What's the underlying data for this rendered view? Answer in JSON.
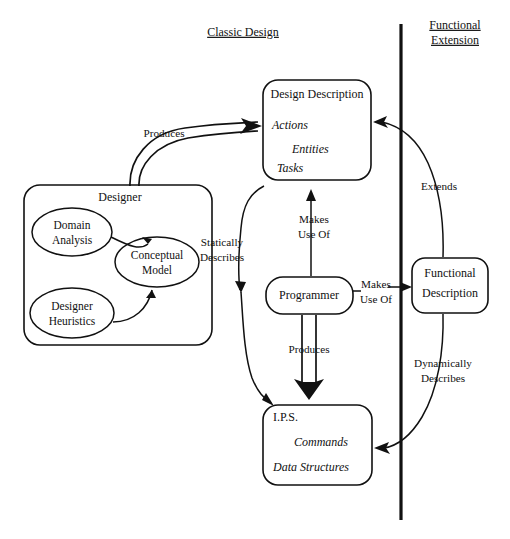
{
  "diagram": {
    "sections": [
      {
        "id": "classic",
        "label": "Classic Design"
      },
      {
        "id": "functional",
        "label_line1": "Functional",
        "label_line2": "Extension"
      }
    ],
    "nodes": {
      "design_description": {
        "title": "Design Description",
        "items": [
          "Actions",
          "Entities",
          "Tasks"
        ]
      },
      "designer": {
        "title": "Designer",
        "ellipses": [
          {
            "id": "domain-analysis",
            "line1": "Domain",
            "line2": "Analysis"
          },
          {
            "id": "conceptual-model",
            "line1": "Conceptual",
            "line2": "Model"
          },
          {
            "id": "designer-heuristics",
            "line1": "Designer",
            "line2": "Heuristics"
          }
        ]
      },
      "programmer": {
        "title": "Programmer"
      },
      "functional_description": {
        "line1": "Functional",
        "line2": "Description"
      },
      "ips": {
        "title": "I.P.S.",
        "items": [
          "Commands",
          "Data Structures"
        ]
      }
    },
    "edges": [
      {
        "id": "designer-produces-design-description",
        "label": "Produces"
      },
      {
        "id": "design-description-statically-describes-ips",
        "line1": "Statically",
        "line2": "Describes"
      },
      {
        "id": "programmer-makes-use-of-design-description",
        "line1": "Makes",
        "line2": "Use Of"
      },
      {
        "id": "programmer-makes-use-of-functional-description",
        "line1": "Makes",
        "line2": "Use Of"
      },
      {
        "id": "programmer-produces-ips",
        "label": "Produces"
      },
      {
        "id": "functional-description-extends-design-description",
        "label": "Extends"
      },
      {
        "id": "functional-description-dynamically-describes-ips",
        "line1": "Dynamically",
        "line2": "Describes"
      }
    ],
    "colors": {
      "ink": "#111111",
      "background": "#ffffff"
    }
  }
}
